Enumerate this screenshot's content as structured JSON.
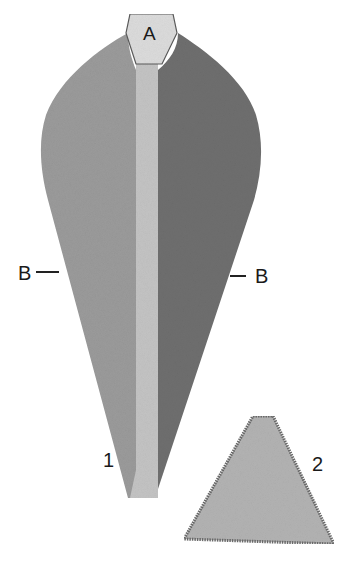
{
  "figure": {
    "part1": {
      "number": "1",
      "tip_label": "A",
      "edge_label_left": "B",
      "edge_label_right": "B",
      "colors": {
        "left_face": "#9b9b9b",
        "right_face": "#6f6f6f",
        "shaft": "#c4c4c4",
        "tip": "#dcdcdc"
      }
    },
    "part2": {
      "number": "2",
      "colors": {
        "fill": "#b3b3b3",
        "edge": "#6a6a6a"
      }
    }
  }
}
